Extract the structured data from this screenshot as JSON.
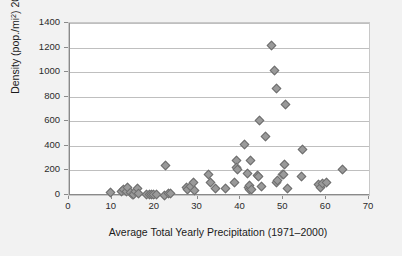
{
  "chart_data": {
    "type": "scatter",
    "title": "",
    "xlabel": "Average Total Yearly Precipitation (1971–2000)",
    "ylabel": "Density (pop./mi2) 2015",
    "ylabel_parts": {
      "pre": "Density (pop./mi",
      "sup": "2",
      "post": ") 2015"
    },
    "xlim": [
      0,
      70
    ],
    "ylim": [
      0,
      1400
    ],
    "xticks": [
      0,
      10,
      20,
      30,
      40,
      50,
      60,
      70
    ],
    "yticks": [
      0,
      200,
      400,
      600,
      800,
      1000,
      1200,
      1400
    ],
    "xtick_labels": [
      "0",
      "10",
      "20",
      "30",
      "40",
      "50",
      "60",
      "70"
    ],
    "ytick_labels": [
      "0",
      "200",
      "400",
      "600",
      "800",
      "1000",
      "1200",
      "1400"
    ],
    "grid": "horizontal",
    "legend": "none",
    "marker": "diamond",
    "marker_fill": "#9a9a9a",
    "marker_edge": "#6e6e6e",
    "plot_background": "#ffffff",
    "figure_background": "#f2f2f2",
    "series": [
      {
        "name": "States",
        "points": [
          [
            9.5,
            25
          ],
          [
            12.1,
            30
          ],
          [
            12.6,
            45
          ],
          [
            13.3,
            32
          ],
          [
            13.6,
            62
          ],
          [
            14.2,
            22
          ],
          [
            14.6,
            12
          ],
          [
            15.0,
            8
          ],
          [
            15.4,
            30
          ],
          [
            15.8,
            58
          ],
          [
            16.2,
            20
          ],
          [
            17.9,
            8
          ],
          [
            18.6,
            10
          ],
          [
            19.1,
            12
          ],
          [
            19.6,
            9
          ],
          [
            20.2,
            10
          ],
          [
            22.1,
            4
          ],
          [
            22.3,
            248
          ],
          [
            23.1,
            18
          ],
          [
            23.6,
            20
          ],
          [
            27.3,
            62
          ],
          [
            27.6,
            48
          ],
          [
            28.2,
            70
          ],
          [
            28.9,
            102
          ],
          [
            29.1,
            40
          ],
          [
            32.5,
            172
          ],
          [
            32.9,
            102
          ],
          [
            34.1,
            58
          ],
          [
            36.5,
            55
          ],
          [
            38.6,
            105
          ],
          [
            38.9,
            282
          ],
          [
            39.0,
            228
          ],
          [
            39.1,
            212
          ],
          [
            40.8,
            418
          ],
          [
            41.6,
            180
          ],
          [
            41.8,
            68
          ],
          [
            42.0,
            52
          ],
          [
            42.1,
            78
          ],
          [
            42.3,
            282
          ],
          [
            42.5,
            45
          ],
          [
            43.8,
            160
          ],
          [
            44.2,
            152
          ],
          [
            44.3,
            612
          ],
          [
            44.9,
            72
          ],
          [
            45.8,
            480
          ],
          [
            47.2,
            1218
          ],
          [
            47.9,
            1018
          ],
          [
            48.2,
            868
          ],
          [
            48.4,
            108
          ],
          [
            48.6,
            122
          ],
          [
            49.6,
            168
          ],
          [
            49.9,
            175
          ],
          [
            50.2,
            250
          ],
          [
            50.4,
            738
          ],
          [
            50.8,
            58
          ],
          [
            54.2,
            152
          ],
          [
            54.4,
            375
          ],
          [
            58.1,
            88
          ],
          [
            58.6,
            68
          ],
          [
            59.0,
            95
          ],
          [
            60.0,
            105
          ],
          [
            63.8,
            215
          ]
        ]
      }
    ]
  }
}
